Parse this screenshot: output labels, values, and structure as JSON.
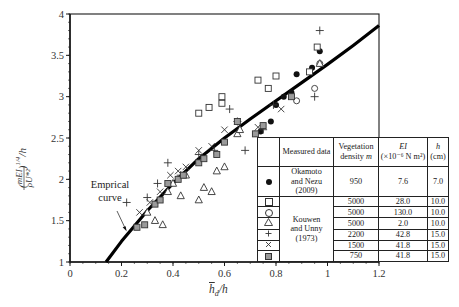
{
  "chart_data": {
    "type": "scatter",
    "title": "",
    "xlabel": "h̄_d / h",
    "ylabel": "(mEI / ρU*²)^(1/4) / h",
    "xlim": [
      0,
      1.2
    ],
    "ylim": [
      1,
      4
    ],
    "x_ticks": [
      "0",
      "0.2",
      "0.4",
      "0.6",
      "0.8",
      "1",
      "1.2"
    ],
    "y_ticks": [
      "1",
      "1.5",
      "2",
      "2.5",
      "3",
      "3.5",
      "4"
    ],
    "grid": false,
    "legend_position": "lower right (table)",
    "annotation": {
      "text_line1": "Emprical",
      "text_line2": "curve",
      "points_to": [
        0.22,
        1.42
      ]
    },
    "curve": {
      "name": "Empirical curve",
      "x": [
        0.14,
        0.2,
        0.3,
        0.4,
        0.5,
        0.6,
        0.7,
        0.8,
        0.9,
        1.0,
        1.1,
        1.2
      ],
      "y": [
        1.0,
        1.25,
        1.62,
        1.95,
        2.25,
        2.5,
        2.73,
        2.95,
        3.17,
        3.39,
        3.62,
        3.86
      ]
    },
    "series": [
      {
        "name": "Okamoto and Nezu (2009)",
        "marker": "filled-circle",
        "density_m": "950",
        "EI": "7.6",
        "h_cm": "7.0",
        "x": [
          0.72,
          0.74,
          0.78,
          0.8,
          0.83,
          0.86,
          0.88,
          0.94,
          0.97
        ],
        "y": [
          2.55,
          2.58,
          2.7,
          2.9,
          3.0,
          3.05,
          3.27,
          3.35,
          3.55
        ]
      },
      {
        "name": "Kouwen and Unny (1973) m=5000 EI=28.0",
        "marker": "open-square",
        "density_m": "5000",
        "EI": "28.0",
        "h_cm": "10.0",
        "x": [
          0.5,
          0.54,
          0.59,
          0.59,
          0.73,
          0.77,
          0.8,
          0.93,
          0.96
        ],
        "y": [
          2.8,
          2.87,
          2.92,
          3.0,
          3.2,
          3.1,
          3.25,
          3.3,
          3.6
        ]
      },
      {
        "name": "Kouwen and Unny (1973) m=5000 EI=130.0",
        "marker": "open-circle",
        "density_m": "5000",
        "EI": "130.0",
        "h_cm": "10.0",
        "x": [
          0.88,
          0.95,
          0.97
        ],
        "y": [
          2.95,
          3.1,
          3.4
        ]
      },
      {
        "name": "Kouwen and Unny (1973) m=5000 EI=2.0",
        "marker": "open-triangle",
        "density_m": "5000",
        "EI": "2.0",
        "h_cm": "10.0",
        "x": [
          0.3,
          0.33,
          0.36,
          0.38,
          0.4,
          0.43,
          0.45,
          0.5,
          0.52,
          0.55,
          0.57,
          0.6,
          0.65,
          0.66,
          0.97
        ],
        "y": [
          1.6,
          1.5,
          1.45,
          1.85,
          1.95,
          1.8,
          2.05,
          1.75,
          1.9,
          1.85,
          2.1,
          2.15,
          2.55,
          2.6,
          3.4
        ]
      },
      {
        "name": "Kouwen and Unny (1973) m=2200 EI=42.8",
        "marker": "plus",
        "density_m": "2200",
        "EI": "42.8",
        "h_cm": "15.0",
        "x": [
          0.22,
          0.3,
          0.34,
          0.38,
          0.43,
          0.5,
          0.56,
          0.62,
          0.65,
          0.68,
          0.75,
          0.79,
          0.95,
          0.97
        ],
        "y": [
          1.72,
          1.78,
          1.95,
          2.2,
          2.05,
          2.3,
          2.35,
          2.85,
          2.7,
          2.35,
          2.6,
          2.9,
          3.0,
          3.8
        ]
      },
      {
        "name": "Kouwen and Unny (1973) m=1500 EI=41.8",
        "marker": "cross",
        "density_m": "1500",
        "EI": "41.8",
        "h_cm": "15.0",
        "x": [
          0.27,
          0.31,
          0.35,
          0.39,
          0.42,
          0.45,
          0.5,
          0.55,
          0.6,
          0.65,
          0.73,
          0.82
        ],
        "y": [
          1.6,
          1.72,
          1.85,
          2.05,
          2.1,
          2.15,
          2.35,
          2.4,
          2.6,
          2.7,
          2.63,
          2.85
        ]
      },
      {
        "name": "Kouwen and Unny (1973) m=750 EI=41.8",
        "marker": "gray-square",
        "density_m": "750",
        "EI": "41.8",
        "h_cm": "15.0",
        "x": [
          0.26,
          0.29,
          0.33,
          0.35,
          0.38,
          0.42,
          0.44,
          0.5,
          0.52,
          0.57,
          0.6,
          0.65,
          0.72,
          0.75,
          0.86
        ],
        "y": [
          1.42,
          1.45,
          1.7,
          1.75,
          1.95,
          2.0,
          2.05,
          2.2,
          2.25,
          2.3,
          2.45,
          2.7,
          2.55,
          2.65,
          3.0
        ]
      }
    ]
  },
  "legend_table": {
    "headers": {
      "measured": "Measured data",
      "density_1": "Vegetation",
      "density_2": "density",
      "density_m": "m",
      "ei_1": "EI",
      "ei_2": "(×10⁻⁶ N m²)",
      "h_1": "h",
      "h_2": "(cm)"
    },
    "groups": {
      "okamoto_1": "Okamoto",
      "okamoto_2": "and Nezu (2009)",
      "kouwen_1": "Kouwen",
      "kouwen_2": "and Unny (1973)"
    },
    "rows": [
      {
        "symbol": "filled-circle",
        "density": "950",
        "ei": "7.6",
        "h": "7.0"
      },
      {
        "symbol": "open-square",
        "density": "5000",
        "ei": "28.0",
        "h": "10.0"
      },
      {
        "symbol": "open-circle",
        "density": "5000",
        "ei": "130.0",
        "h": "10.0"
      },
      {
        "symbol": "open-triangle",
        "density": "5000",
        "ei": "2.0",
        "h": "10.0"
      },
      {
        "symbol": "plus",
        "density": "2200",
        "ei": "42.8",
        "h": "15.0"
      },
      {
        "symbol": "cross",
        "density": "1500",
        "ei": "41.8",
        "h": "15.0"
      },
      {
        "symbol": "gray-square",
        "density": "750",
        "ei": "41.8",
        "h": "15.0"
      }
    ]
  },
  "labels": {
    "annotation_line1": "Emprical",
    "annotation_line2": "curve",
    "xlabel_main": "h",
    "xlabel_sub": "d",
    "xlabel_rest": "/h"
  },
  "colors": {
    "axis": "#1a1a1a",
    "curve": "#000000",
    "gray_marker": "#9a9a9a"
  }
}
